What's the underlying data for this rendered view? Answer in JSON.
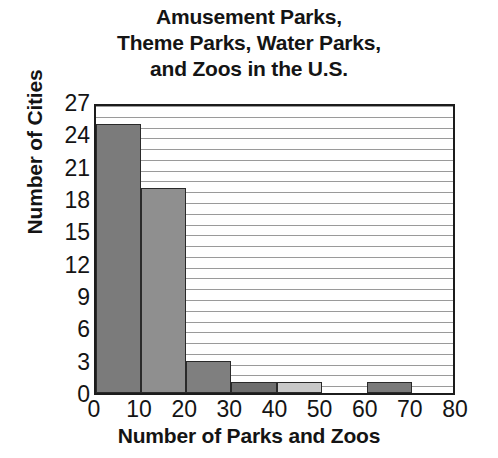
{
  "chart_data": {
    "type": "bar",
    "title": "Amusement Parks, Theme Parks, Water Parks, and Zoos in the U.S.",
    "title_lines": [
      "Amusement Parks,",
      "Theme Parks, Water Parks,",
      "and Zoos in the U.S."
    ],
    "xlabel": "Number of Parks and Zoos",
    "ylabel": "Number of Cities",
    "xlim": [
      0,
      80
    ],
    "ylim": [
      0,
      27
    ],
    "grid": true,
    "grid_axis": "y",
    "grid_interval": 1,
    "legend": null,
    "bin_width": 10,
    "x_tick_labels": [
      "0",
      "10",
      "20",
      "30",
      "40",
      "50",
      "60",
      "70",
      "80"
    ],
    "x_ticks": [
      0,
      10,
      20,
      30,
      40,
      50,
      60,
      70,
      80
    ],
    "y_tick_labels": [
      "0",
      "3",
      "6",
      "9",
      "12",
      "15",
      "18",
      "21",
      "24",
      "27"
    ],
    "y_ticks": [
      0,
      3,
      6,
      9,
      12,
      15,
      18,
      21,
      24,
      27
    ],
    "categories": [
      "0-10",
      "10-20",
      "20-30",
      "30-40",
      "40-50",
      "50-60",
      "60-70",
      "70-80"
    ],
    "bin_starts": [
      0,
      10,
      20,
      30,
      40,
      50,
      60,
      70
    ],
    "values": [
      25,
      19,
      3,
      1,
      1,
      0,
      1,
      0
    ],
    "bar_colors": [
      "#7b7b7b",
      "#8f8f8f",
      "#7f7f7f",
      "#6e6e6e",
      "#c9c9c9",
      "#ffffff",
      "#7a7a7a",
      "#ffffff"
    ],
    "bar_edge_color": "#2a2a2a",
    "axis_color": "#1c1c1c",
    "gridline_color": "#9a9a9a",
    "background_color": "#ffffff",
    "text_color": "#141414"
  }
}
